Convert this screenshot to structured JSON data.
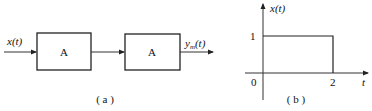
{
  "diagram_a": {
    "input_label": "x(t)",
    "blocks": [
      {
        "label": "A"
      },
      {
        "label": "A"
      }
    ],
    "output_label": "y",
    "output_subscript": "m",
    "output_suffix": "(t)",
    "caption": "( a )"
  },
  "diagram_b": {
    "y_axis_label": "x(t)",
    "x_axis_label": "t",
    "origin_label": "0",
    "y_tick_label": "1",
    "x_tick_label": "2",
    "caption": "( b )",
    "signal": {
      "type": "rectangular pulse",
      "amplitude": 1,
      "start": 0,
      "end": 2
    }
  },
  "colors": {
    "stroke": "#222222",
    "background": "#ffffff"
  }
}
